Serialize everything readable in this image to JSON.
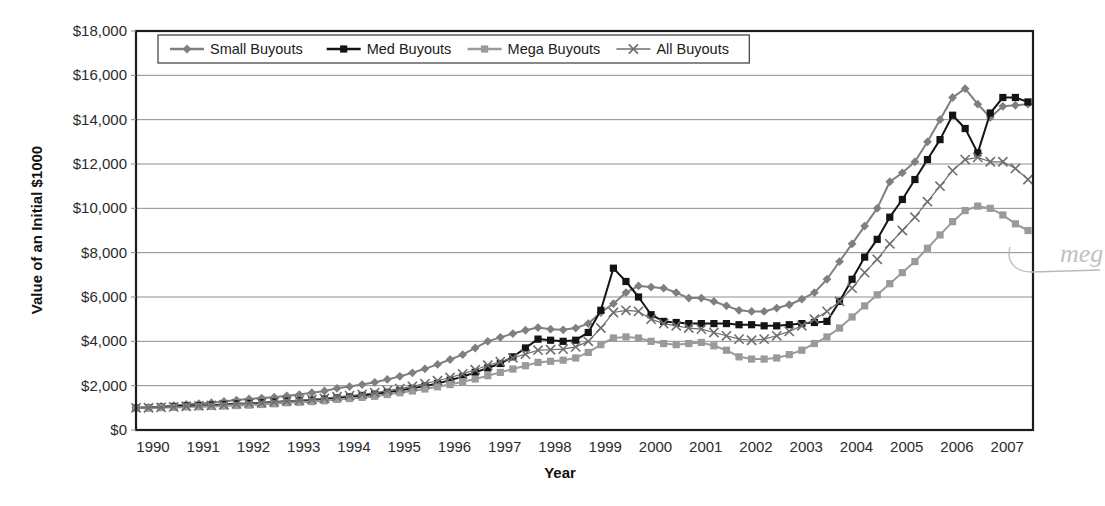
{
  "chart_data": {
    "type": "line",
    "title": "",
    "xlabel": "Year",
    "ylabel": "Value of an Initial $1000",
    "xlim": [
      1990,
      2007.85
    ],
    "ylim": [
      0,
      18000
    ],
    "grid": true,
    "legend_position": "top-left",
    "ytick_labels": [
      "$18,000",
      "$16,000",
      "$14,000",
      "$12,000",
      "$10,000",
      "$8,000",
      "$6,000",
      "$4,000",
      "$2,000",
      "$0"
    ],
    "ytick_values": [
      18000,
      16000,
      14000,
      12000,
      10000,
      8000,
      6000,
      4000,
      2000,
      0
    ],
    "xtick_labels": [
      "1990",
      "1991",
      "1992",
      "1993",
      "1994",
      "1995",
      "1996",
      "1997",
      "1998",
      "1999",
      "2000",
      "2001",
      "2002",
      "2003",
      "2004",
      "2005",
      "2006",
      "2007"
    ],
    "xtick_values": [
      1990,
      1991,
      1992,
      1993,
      1994,
      1995,
      1996,
      1997,
      1998,
      1999,
      2000,
      2001,
      2002,
      2003,
      2004,
      2005,
      2006,
      2007
    ],
    "x": [
      1990.0,
      1990.25,
      1990.5,
      1990.75,
      1991.0,
      1991.25,
      1991.5,
      1991.75,
      1992.0,
      1992.25,
      1992.5,
      1992.75,
      1993.0,
      1993.25,
      1993.5,
      1993.75,
      1994.0,
      1994.25,
      1994.5,
      1994.75,
      1995.0,
      1995.25,
      1995.5,
      1995.75,
      1996.0,
      1996.25,
      1996.5,
      1996.75,
      1997.0,
      1997.25,
      1997.5,
      1997.75,
      1998.0,
      1998.25,
      1998.5,
      1998.75,
      1999.0,
      1999.25,
      1999.5,
      1999.75,
      2000.0,
      2000.25,
      2000.5,
      2000.75,
      2001.0,
      2001.25,
      2001.5,
      2001.75,
      2002.0,
      2002.25,
      2002.5,
      2002.75,
      2003.0,
      2003.25,
      2003.5,
      2003.75,
      2004.0,
      2004.25,
      2004.5,
      2004.75,
      2005.0,
      2005.25,
      2005.5,
      2005.75,
      2006.0,
      2006.25,
      2006.5,
      2006.75,
      2007.0,
      2007.25,
      2007.5,
      2007.75
    ],
    "series": [
      {
        "name": "Small Buyouts",
        "marker": "diamond",
        "color": "#7f7f7f",
        "values": [
          1000,
          1020,
          1060,
          1100,
          1150,
          1190,
          1230,
          1290,
          1350,
          1400,
          1440,
          1480,
          1540,
          1600,
          1680,
          1760,
          1880,
          1960,
          2050,
          2150,
          2280,
          2420,
          2580,
          2760,
          2960,
          3180,
          3400,
          3700,
          4000,
          4180,
          4350,
          4500,
          4620,
          4550,
          4520,
          4600,
          4800,
          5300,
          5700,
          6200,
          6500,
          6450,
          6400,
          6200,
          5950,
          5950,
          5800,
          5600,
          5400,
          5350,
          5350,
          5500,
          5650,
          5900,
          6200,
          6800,
          7600,
          8400,
          9200,
          10000,
          11200,
          11600,
          12100,
          13000,
          14000,
          15000,
          15400,
          14700,
          14100,
          14600,
          14650,
          14700
        ]
      },
      {
        "name": "Med Buyouts",
        "marker": "square",
        "color": "#141414",
        "values": [
          1000,
          1010,
          1030,
          1060,
          1090,
          1100,
          1120,
          1150,
          1180,
          1200,
          1230,
          1260,
          1300,
          1320,
          1350,
          1400,
          1450,
          1500,
          1560,
          1620,
          1700,
          1780,
          1880,
          1980,
          2100,
          2250,
          2400,
          2600,
          2800,
          3000,
          3300,
          3700,
          4100,
          4050,
          4000,
          4050,
          4400,
          5400,
          7300,
          6700,
          6000,
          5200,
          4900,
          4850,
          4800,
          4800,
          4800,
          4800,
          4750,
          4750,
          4700,
          4700,
          4750,
          4800,
          4850,
          4900,
          5800,
          6800,
          7800,
          8600,
          9600,
          10400,
          11300,
          12200,
          13100,
          14200,
          13600,
          12500,
          14300,
          15000,
          15000,
          14800
        ]
      },
      {
        "name": "Mega Buyouts",
        "marker": "square",
        "color": "#9a9a9a",
        "values": [
          1000,
          1000,
          1010,
          1020,
          1040,
          1050,
          1060,
          1080,
          1100,
          1120,
          1150,
          1180,
          1230,
          1250,
          1280,
          1320,
          1380,
          1420,
          1470,
          1520,
          1600,
          1680,
          1760,
          1850,
          1950,
          2050,
          2180,
          2300,
          2450,
          2600,
          2750,
          2900,
          3050,
          3100,
          3150,
          3250,
          3500,
          3850,
          4150,
          4200,
          4150,
          4000,
          3900,
          3850,
          3900,
          3950,
          3800,
          3600,
          3300,
          3200,
          3200,
          3250,
          3400,
          3600,
          3900,
          4200,
          4600,
          5100,
          5600,
          6100,
          6600,
          7100,
          7600,
          8200,
          8800,
          9400,
          9900,
          10100,
          10000,
          9700,
          9300,
          9000
        ]
      },
      {
        "name": "All Buyouts",
        "marker": "x",
        "color": "#6e6e6e",
        "values": [
          1000,
          1005,
          1020,
          1040,
          1070,
          1090,
          1110,
          1140,
          1180,
          1200,
          1230,
          1260,
          1310,
          1340,
          1380,
          1430,
          1500,
          1550,
          1610,
          1680,
          1780,
          1870,
          1970,
          2090,
          2220,
          2370,
          2530,
          2720,
          2920,
          3080,
          3250,
          3420,
          3600,
          3620,
          3650,
          3750,
          4000,
          4600,
          5300,
          5400,
          5350,
          5000,
          4800,
          4700,
          4600,
          4550,
          4400,
          4250,
          4100,
          4050,
          4100,
          4250,
          4450,
          4700,
          5000,
          5350,
          5800,
          6400,
          7100,
          7700,
          8400,
          9000,
          9600,
          10300,
          11000,
          11700,
          12200,
          12300,
          12100,
          12100,
          11800,
          11300
        ]
      }
    ],
    "annotation": {
      "text": "meg",
      "description": "handwritten-pencil-note"
    }
  }
}
